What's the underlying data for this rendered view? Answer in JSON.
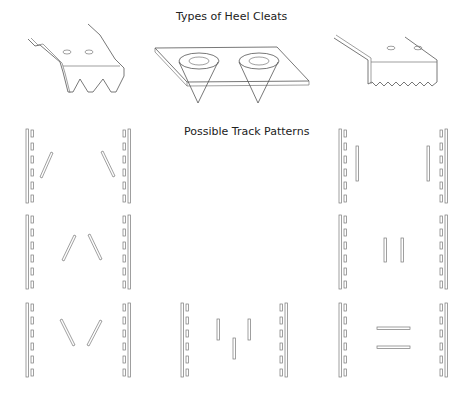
{
  "figure": {
    "heel_cleats": {
      "title": "Types of Heel Cleats",
      "items": [
        {
          "name": "toothed-cleat-large-teeth",
          "teeth": 3,
          "holes": 2
        },
        {
          "name": "plate-with-two-cone-spikes",
          "spikes": 2
        },
        {
          "name": "angle-cleat-serrated-edge",
          "teeth": 7,
          "holes": 2
        }
      ]
    },
    "track_patterns": {
      "title": "Possible Track Patterns",
      "rows": [
        {
          "cells": [
            {
              "pattern": "diagonals-converging-down",
              "cleats": 2
            },
            {
              "pattern": "empty",
              "cleats": 0
            },
            {
              "pattern": "vertical-pair-wide",
              "cleats": 2
            }
          ]
        },
        {
          "cells": [
            {
              "pattern": "inverted-v",
              "cleats": 2
            },
            {
              "pattern": "empty",
              "cleats": 0
            },
            {
              "pattern": "vertical-pair-narrow",
              "cleats": 2
            }
          ]
        },
        {
          "cells": [
            {
              "pattern": "v-shape",
              "cleats": 2
            },
            {
              "pattern": "staggered-vertical-three",
              "cleats": 3
            },
            {
              "pattern": "horizontal-pair",
              "cleats": 2
            }
          ]
        }
      ]
    }
  }
}
